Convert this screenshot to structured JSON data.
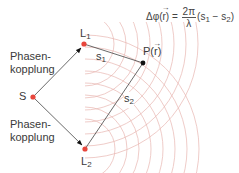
{
  "diagram": {
    "type": "phased-array-interference",
    "nodes": {
      "source": {
        "label": "S",
        "x": 33,
        "y": 97,
        "color": "#e8463c"
      },
      "L1": {
        "label": "L",
        "sub": "1",
        "x": 84,
        "y": 44,
        "color": "#e8463c"
      },
      "L2": {
        "label": "L",
        "sub": "2",
        "x": 85,
        "y": 149,
        "color": "#e8463c"
      },
      "point": {
        "label": "P(r)",
        "x": 143,
        "y": 63,
        "color": "#111111"
      }
    },
    "edges": [
      {
        "from": "S",
        "to": "L1",
        "label": "Phasen-\nkopplung",
        "arrow": true
      },
      {
        "from": "S",
        "to": "L2",
        "label": "Phasen-\nkopplung",
        "arrow": true
      },
      {
        "from": "L1",
        "to": "P",
        "label": "s1"
      },
      {
        "from": "L2",
        "to": "P",
        "label": "s2"
      }
    ],
    "labels": {
      "coupling_top_1": "Phasen-",
      "coupling_top_2": "kopplung",
      "coupling_bottom_1": "Phasen-",
      "coupling_bottom_2": "kopplung",
      "S": "S",
      "L1": "L",
      "L1_sub": "1",
      "L2": "L",
      "L2_sub": "2",
      "s1": "s",
      "s1_sub": "1",
      "s2": "s",
      "s2_sub": "2",
      "P_prefix": "P(",
      "P_vec": "r",
      "P_suffix": ")"
    },
    "formula": {
      "lhs_prefix": "Δφ(",
      "lhs_vec": "r",
      "lhs_suffix": ") =",
      "frac_num": "2π",
      "frac_den": "λ",
      "rhs": "(s",
      "rhs_sub1": "1",
      "rhs_mid": " − s",
      "rhs_sub2": "2",
      "rhs_end": ")"
    },
    "colors": {
      "wave": "#e9b5b0",
      "line": "#555555",
      "dot_red": "#e8463c",
      "dot_black": "#111111"
    }
  }
}
